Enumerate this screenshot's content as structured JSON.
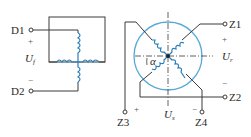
{
  "left_diagram": {
    "terminals": [
      {
        "label": "D1",
        "polarity": "+"
      },
      {
        "label": "D2",
        "polarity": "−"
      }
    ],
    "voltage": {
      "symbol": "U",
      "subscript": "f"
    }
  },
  "right_diagram": {
    "terminals": [
      {
        "label": "Z1",
        "polarity": "+"
      },
      {
        "label": "Z2",
        "polarity": "−"
      },
      {
        "label": "Z3",
        "polarity": "+"
      },
      {
        "label": "Z4",
        "polarity": "−"
      }
    ],
    "voltage_right": {
      "symbol": "U",
      "subscript": "r"
    },
    "voltage_bottom": {
      "symbol": "U",
      "subscript": "s"
    },
    "angle_label": "α"
  },
  "colors": {
    "wire": "#3a3a3a",
    "coil": "#2b7fb8",
    "rotor_circle": "#5aa8d6"
  }
}
